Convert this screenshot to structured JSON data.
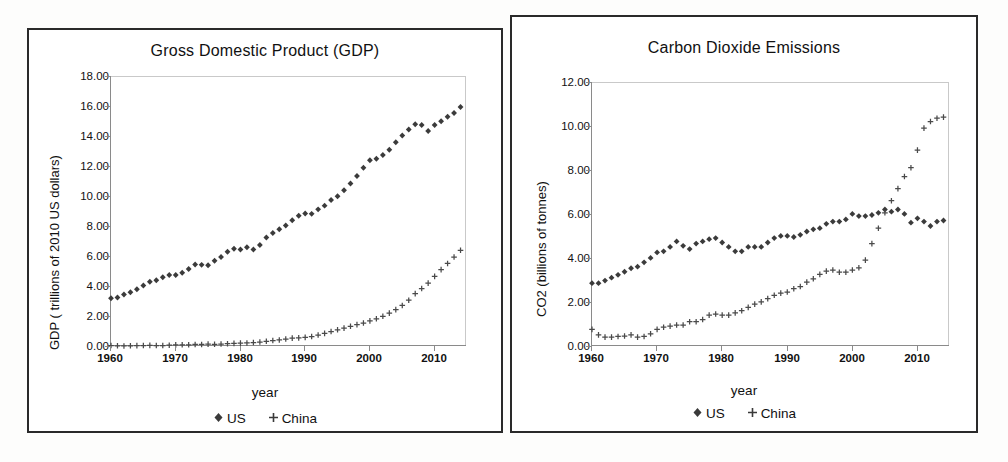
{
  "page": {
    "background": "#fdfdfc",
    "panel_border_color": "#2a2a2a"
  },
  "axis_label_x": "year",
  "legend": {
    "us": {
      "label": "US",
      "marker": "diamond-marker"
    },
    "china": {
      "label": "China",
      "marker": "plus-marker"
    }
  },
  "charts": [
    {
      "id": "gdp",
      "title": "Gross Domestic Product (GDP)",
      "ylabel": "GDP ( trillions of 2010 US dollars)",
      "xlabel": "year",
      "yticks": [
        "0.00",
        "2.00",
        "4.00",
        "6.00",
        "8.00",
        "10.00",
        "12.00",
        "14.00",
        "16.00",
        "18.00"
      ],
      "xticks": [
        "1960",
        "1970",
        "1980",
        "1990",
        "2000",
        "2010"
      ]
    },
    {
      "id": "co2",
      "title": "Carbon Dioxide Emissions",
      "ylabel": "CO2 (billions of tonnes)",
      "xlabel": "year",
      "yticks": [
        "0.00",
        "2.00",
        "4.00",
        "6.00",
        "8.00",
        "10.00",
        "12.00"
      ],
      "xticks": [
        "1960",
        "1970",
        "1980",
        "1990",
        "2000",
        "2010"
      ]
    }
  ],
  "chart_data": [
    {
      "type": "scatter",
      "title": "Gross Domestic Product (GDP)",
      "xlabel": "year",
      "ylabel": "GDP ( trillions of 2010 US dollars)",
      "xlim": [
        1960,
        2015
      ],
      "ylim": [
        0,
        18
      ],
      "ytick_step": 2,
      "xtick_step": 10,
      "grid": false,
      "legend_position": "bottom",
      "x": [
        1960,
        1961,
        1962,
        1963,
        1964,
        1965,
        1966,
        1967,
        1968,
        1969,
        1970,
        1971,
        1972,
        1973,
        1974,
        1975,
        1976,
        1977,
        1978,
        1979,
        1980,
        1981,
        1982,
        1983,
        1984,
        1985,
        1986,
        1987,
        1988,
        1989,
        1990,
        1991,
        1992,
        1993,
        1994,
        1995,
        1996,
        1997,
        1998,
        1999,
        2000,
        2001,
        2002,
        2003,
        2004,
        2005,
        2006,
        2007,
        2008,
        2009,
        2010,
        2011,
        2012,
        2013,
        2014
      ],
      "series": [
        {
          "name": "US",
          "marker": "diamond",
          "values": [
            3.25,
            3.3,
            3.5,
            3.65,
            3.85,
            4.1,
            4.35,
            4.45,
            4.65,
            4.8,
            4.8,
            4.95,
            5.2,
            5.5,
            5.48,
            5.45,
            5.75,
            6.0,
            6.35,
            6.55,
            6.5,
            6.65,
            6.5,
            6.8,
            7.3,
            7.6,
            7.85,
            8.1,
            8.45,
            8.75,
            8.9,
            8.88,
            9.18,
            9.42,
            9.8,
            10.05,
            10.45,
            10.9,
            11.4,
            11.95,
            12.45,
            12.55,
            12.8,
            13.15,
            13.65,
            14.1,
            14.5,
            14.85,
            14.8,
            14.4,
            14.8,
            15.05,
            15.35,
            15.6,
            16.0
          ],
          "value_end_note": "rises to ~16.5 by 2014"
        },
        {
          "name": "China",
          "marker": "plus",
          "values": [
            0.1,
            0.08,
            0.07,
            0.08,
            0.09,
            0.1,
            0.11,
            0.1,
            0.1,
            0.12,
            0.14,
            0.15,
            0.15,
            0.17,
            0.17,
            0.19,
            0.18,
            0.2,
            0.22,
            0.24,
            0.26,
            0.27,
            0.3,
            0.33,
            0.38,
            0.43,
            0.47,
            0.53,
            0.59,
            0.61,
            0.64,
            0.7,
            0.8,
            0.91,
            1.03,
            1.15,
            1.26,
            1.38,
            1.49,
            1.6,
            1.74,
            1.88,
            2.05,
            2.26,
            2.49,
            2.77,
            3.12,
            3.56,
            3.9,
            4.26,
            4.71,
            5.16,
            5.57,
            6.0,
            6.45
          ],
          "value_end_note": "reaches ~8.6 by 2014"
        }
      ]
    },
    {
      "type": "scatter",
      "title": "Carbon Dioxide Emissions",
      "xlabel": "year",
      "ylabel": "CO2 (billions of tonnes)",
      "xlim": [
        1960,
        2015
      ],
      "ylim": [
        0,
        12
      ],
      "ytick_step": 2,
      "xtick_step": 10,
      "grid": false,
      "legend_position": "bottom",
      "x": [
        1960,
        1961,
        1962,
        1963,
        1964,
        1965,
        1966,
        1967,
        1968,
        1969,
        1970,
        1971,
        1972,
        1973,
        1974,
        1975,
        1976,
        1977,
        1978,
        1979,
        1980,
        1981,
        1982,
        1983,
        1984,
        1985,
        1986,
        1987,
        1988,
        1989,
        1990,
        1991,
        1992,
        1993,
        1994,
        1995,
        1996,
        1997,
        1998,
        1999,
        2000,
        2001,
        2002,
        2003,
        2004,
        2005,
        2006,
        2007,
        2008,
        2009,
        2010,
        2011,
        2012,
        2013,
        2014
      ],
      "series": [
        {
          "name": "US",
          "marker": "diamond",
          "values": [
            2.9,
            2.9,
            3.02,
            3.15,
            3.28,
            3.42,
            3.58,
            3.65,
            3.85,
            4.05,
            4.3,
            4.35,
            4.55,
            4.8,
            4.6,
            4.45,
            4.7,
            4.8,
            4.9,
            4.95,
            4.75,
            4.55,
            4.35,
            4.35,
            4.55,
            4.55,
            4.55,
            4.75,
            4.95,
            5.05,
            5.05,
            5.0,
            5.1,
            5.25,
            5.35,
            5.4,
            5.6,
            5.7,
            5.7,
            5.8,
            6.05,
            5.95,
            5.95,
            6.0,
            6.1,
            6.25,
            6.15,
            6.25,
            6.05,
            5.65,
            5.85,
            5.7,
            5.5,
            5.7,
            5.75
          ]
        },
        {
          "name": "China",
          "marker": "plus",
          "values": [
            0.8,
            0.55,
            0.45,
            0.45,
            0.48,
            0.5,
            0.55,
            0.45,
            0.48,
            0.6,
            0.8,
            0.9,
            0.95,
            1.0,
            1.0,
            1.15,
            1.15,
            1.25,
            1.45,
            1.5,
            1.45,
            1.45,
            1.55,
            1.65,
            1.8,
            1.95,
            2.05,
            2.2,
            2.35,
            2.45,
            2.5,
            2.65,
            2.75,
            2.95,
            3.1,
            3.3,
            3.45,
            3.5,
            3.4,
            3.4,
            3.5,
            3.6,
            3.95,
            4.7,
            5.4,
            6.1,
            6.65,
            7.2,
            7.75,
            8.15,
            8.95,
            9.95,
            10.25,
            10.4,
            10.45
          ]
        }
      ]
    }
  ]
}
